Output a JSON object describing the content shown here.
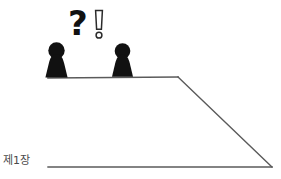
{
  "canvas": {
    "width": 281,
    "height": 179,
    "background": "#ffffff"
  },
  "illustration": {
    "title": "cliff-edge scene with two figures",
    "chapter_label": "제1장",
    "chapter_label_color": "#4a4a4a",
    "question_mark": "?",
    "exclamation_mark": "!",
    "line_color": "#5a5a5a",
    "figure_color": "#111111",
    "figures": [
      {
        "name": "left-figure",
        "x": 56,
        "ground_y": 78
      },
      {
        "name": "right-figure",
        "x": 122,
        "ground_y": 77
      }
    ],
    "platform": {
      "start_x": 48,
      "start_y": 78,
      "corner_x": 178,
      "corner_y": 77
    },
    "slope": {
      "top_x": 178,
      "top_y": 77,
      "bottom_x": 272,
      "bottom_y": 167
    },
    "ground": {
      "start_x": 48,
      "start_y": 167,
      "end_x": 272,
      "end_y": 167
    }
  }
}
